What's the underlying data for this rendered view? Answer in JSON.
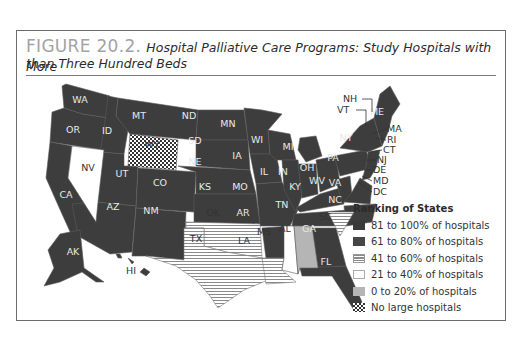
{
  "figure": {
    "number": "FIGURE 20.2.",
    "title_line1": "Hospital Palliative Care Programs: Study Hospitals with More",
    "title_line2": "than Three Hundred Beds"
  },
  "legend": {
    "title": "Ranking of States",
    "items": [
      {
        "label": "81 to 100% of hospitals",
        "pattern": "solid-darkest",
        "color": "#3a3a3a"
      },
      {
        "label": "61 to 80% of hospitals",
        "pattern": "solid-dark",
        "color": "#444444"
      },
      {
        "label": "41 to 60% of hospitals",
        "pattern": "horizontal-stripes",
        "color": "#c8c8c8"
      },
      {
        "label": "21 to 40% of hospitals",
        "pattern": "white",
        "color": "#ffffff"
      },
      {
        "label": "0 to 20% of hospitals",
        "pattern": "solid-light-gray",
        "color": "#b5b5b5"
      },
      {
        "label": "No large hospitals",
        "pattern": "checkerboard",
        "color": "#3a3a3a"
      }
    ]
  },
  "states": {
    "WA": "WA",
    "OR": "OR",
    "CA": "CA",
    "ID": "ID",
    "NV": "NV",
    "MT": "MT",
    "WY": "WY",
    "UT": "UT",
    "AZ": "AZ",
    "CO": "CO",
    "NM": "NM",
    "ND": "ND",
    "SD": "SD",
    "NE": "NE",
    "KS": "KS",
    "OK": "OK",
    "TX": "TX",
    "MN": "MN",
    "IA": "IA",
    "MO": "MO",
    "AR": "AR",
    "LA": "LA",
    "WI": "WI",
    "IL": "IL",
    "MS": "MS",
    "MI": "MI",
    "IN": "IN",
    "KY": "KY",
    "TN": "TN",
    "AL": "AL",
    "OH": "OH",
    "WV": "WV",
    "GA": "GA",
    "FL": "FL",
    "SC": "SC",
    "NC": "NC",
    "VA": "VA",
    "PA": "PA",
    "NY": "NY",
    "ME": "ME",
    "AK": "AK",
    "HI": "HI",
    "NH": "NH",
    "VT": "VT",
    "MA": "MA",
    "RI": "RI",
    "CT": "CT",
    "NJ": "NJ",
    "DE": "DE",
    "MD": "MD",
    "DC": "DC"
  },
  "map_data": {
    "type": "choropleth",
    "categories": {
      "81-100": [
        "WA",
        "OR",
        "CA",
        "ID",
        "MT",
        "UT",
        "AZ",
        "CO",
        "NM",
        "ND",
        "SD",
        "NE",
        "KS",
        "MN",
        "IA",
        "MO",
        "AR",
        "WI",
        "IL",
        "MI",
        "IN",
        "OH",
        "KY",
        "TN",
        "WV",
        "VA",
        "NC",
        "GA",
        "FL",
        "PA",
        "NY",
        "ME",
        "NH",
        "VT",
        "MA",
        "RI",
        "CT",
        "NJ",
        "DE",
        "MD",
        "DC",
        "AK",
        "HI"
      ],
      "41-60": [
        "OK",
        "TX",
        "LA",
        "SC"
      ],
      "21-40": [
        "NV",
        "MS"
      ],
      "0-20": [
        "AL"
      ],
      "no_large_hospitals": [
        "WY"
      ]
    }
  }
}
